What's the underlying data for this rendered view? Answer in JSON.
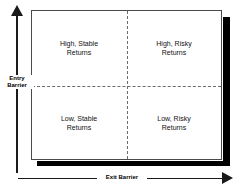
{
  "figure": {
    "type": "2x2-matrix",
    "title": "",
    "axes": {
      "y": {
        "label": "Entry\nBarrier",
        "direction": "up",
        "arrow_icon": "arrow-up-icon"
      },
      "x": {
        "label": "Exit Barrier",
        "direction": "right",
        "arrow_icon": "arrow-right-icon"
      }
    },
    "quadrants": [
      {
        "position": "top-left",
        "entry_barrier": "high",
        "exit_barrier": "low",
        "label": "High, Stable\nReturns"
      },
      {
        "position": "top-right",
        "entry_barrier": "high",
        "exit_barrier": "high",
        "label": "High, Risky\nReturns"
      },
      {
        "position": "bottom-left",
        "entry_barrier": "low",
        "exit_barrier": "low",
        "label": "Low, Stable\nReturns"
      },
      {
        "position": "bottom-right",
        "entry_barrier": "low",
        "exit_barrier": "high",
        "label": "Low, Risky\nReturns"
      }
    ],
    "colors": {
      "background": "#ffffff",
      "box_border": "#4a4a4a",
      "divider": "#6b6b6b",
      "axis": "#1a1a1a",
      "shadow": "#000000",
      "text": "#111111"
    }
  },
  "chart_data": {
    "type": "table",
    "title": "",
    "xlabel": "Exit Barrier",
    "ylabel": "Entry Barrier",
    "x_categories": [
      "Low",
      "High"
    ],
    "y_categories": [
      "High",
      "Low"
    ],
    "cells": [
      [
        "High, Stable Returns",
        "High, Risky Returns"
      ],
      [
        "Low, Stable Returns",
        "Low, Risky Returns"
      ]
    ],
    "grid": true,
    "legend": "none"
  }
}
